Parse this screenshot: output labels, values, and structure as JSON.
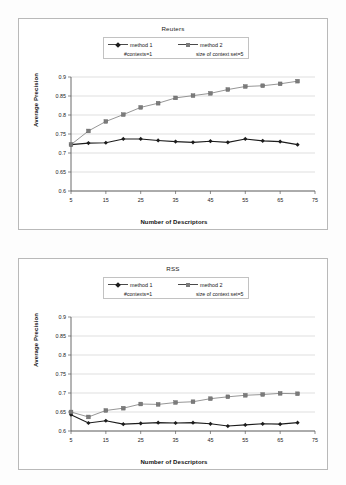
{
  "figure": {
    "background": "#fdfdfd",
    "frame_color": "#b9b9b9"
  },
  "charts": [
    {
      "id": "reuters",
      "title": "Reuters",
      "xlabel": "Number of Descriptors",
      "ylabel": "Average Precision",
      "xlim": [
        5,
        75
      ],
      "ylim": [
        0.6,
        0.9
      ],
      "xticks": [
        "5",
        "15",
        "25",
        "35",
        "45",
        "55",
        "65",
        "75"
      ],
      "xtick_values": [
        5,
        15,
        25,
        35,
        45,
        55,
        65,
        75
      ],
      "yticks": [
        "0.6",
        "0.65",
        "0.7",
        "0.75",
        "0.8",
        "0.85",
        "0.9"
      ],
      "ytick_values": [
        0.6,
        0.65,
        0.7,
        0.75,
        0.8,
        0.85,
        0.9
      ],
      "grid": true,
      "legend_position": "top-center",
      "legend": [
        {
          "label": "method 1",
          "sub": "#contexts=1",
          "marker": "diamond",
          "color": "#1c1c1c"
        },
        {
          "label": "method 2",
          "sub": "size of context set=5",
          "marker": "square",
          "color": "#7b7b7b"
        }
      ],
      "chart_data": {
        "type": "line",
        "title": "Reuters",
        "xlabel": "Number of Descriptors",
        "ylabel": "Average Precision",
        "xlim": [
          5,
          75
        ],
        "ylim": [
          0.6,
          0.9
        ],
        "grid": true,
        "legend_position": "top-center",
        "x": [
          5,
          10,
          15,
          20,
          25,
          30,
          35,
          40,
          45,
          50,
          55,
          60,
          65,
          70
        ],
        "series": [
          {
            "name": "method 1",
            "marker": "diamond",
            "color": "#1c1c1c",
            "values": [
              0.722,
              0.726,
              0.727,
              0.737,
              0.737,
              0.733,
              0.73,
              0.728,
              0.731,
              0.728,
              0.737,
              0.732,
              0.73,
              0.722
            ]
          },
          {
            "name": "method 2",
            "marker": "square",
            "color": "#7b7b7b",
            "values": [
              0.722,
              0.758,
              0.783,
              0.801,
              0.82,
              0.831,
              0.845,
              0.851,
              0.857,
              0.867,
              0.875,
              0.877,
              0.882,
              0.889
            ]
          }
        ]
      }
    },
    {
      "id": "rss",
      "title": "RSS",
      "xlabel": "Number of Descriptors",
      "ylabel": "Average Precision",
      "xlim": [
        5,
        75
      ],
      "ylim": [
        0.6,
        0.9
      ],
      "xticks": [
        "5",
        "15",
        "25",
        "35",
        "45",
        "55",
        "65",
        "75"
      ],
      "xtick_values": [
        5,
        15,
        25,
        35,
        45,
        55,
        65,
        75
      ],
      "yticks": [
        "0.6",
        "0.65",
        "0.7",
        "0.75",
        "0.8",
        "0.85",
        "0.9"
      ],
      "ytick_values": [
        0.6,
        0.65,
        0.7,
        0.75,
        0.8,
        0.85,
        0.9
      ],
      "grid": true,
      "legend_position": "top-center",
      "legend": [
        {
          "label": "method 1",
          "sub": "#contexts=1",
          "marker": "diamond",
          "color": "#1c1c1c"
        },
        {
          "label": "method 2",
          "sub": "size of context set=5",
          "marker": "square",
          "color": "#7b7b7b"
        }
      ],
      "chart_data": {
        "type": "line",
        "title": "RSS",
        "xlabel": "Number of Descriptors",
        "ylabel": "Average Precision",
        "xlim": [
          5,
          75
        ],
        "ylim": [
          0.6,
          0.9
        ],
        "grid": true,
        "legend_position": "top-center",
        "x": [
          5,
          10,
          15,
          20,
          25,
          30,
          35,
          40,
          45,
          50,
          55,
          60,
          65,
          70
        ],
        "series": [
          {
            "name": "method 1",
            "marker": "diamond",
            "color": "#1c1c1c",
            "values": [
              0.643,
              0.621,
              0.627,
              0.618,
              0.62,
              0.622,
              0.621,
              0.622,
              0.619,
              0.613,
              0.616,
              0.619,
              0.618,
              0.622
            ]
          },
          {
            "name": "method 2",
            "marker": "square",
            "color": "#7b7b7b",
            "values": [
              0.65,
              0.637,
              0.654,
              0.66,
              0.671,
              0.67,
              0.675,
              0.677,
              0.685,
              0.69,
              0.694,
              0.696,
              0.699,
              0.698
            ]
          }
        ]
      }
    }
  ]
}
